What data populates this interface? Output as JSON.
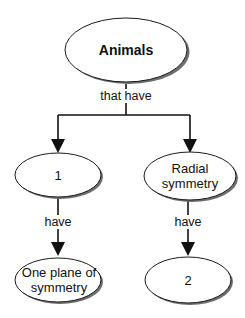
{
  "diagram": {
    "type": "concept-map",
    "colors": {
      "outline": "#1a1a1a",
      "shadow": "#6e6e6e",
      "fill": "#ffffff",
      "line": "#111111"
    },
    "nodes": {
      "root": {
        "label": "Animals"
      },
      "left_mid": {
        "label": "1"
      },
      "right_mid": {
        "label_line1": "Radial",
        "label_line2": "symmetry"
      },
      "left_bottom": {
        "label_line1": "One plane of",
        "label_line2": "symmetry"
      },
      "right_bottom": {
        "label": "2"
      }
    },
    "links": {
      "root_to_mid": "that have",
      "left_mid_to_bottom": "have",
      "right_mid_to_bottom": "have"
    }
  }
}
